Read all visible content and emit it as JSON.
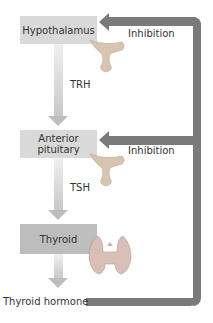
{
  "diagram": {
    "nodes": [
      {
        "id": "hypothalamus",
        "label": "Hypothalamus"
      },
      {
        "id": "anterior-pituitary",
        "label": "Anterior pituitary",
        "line1": "Anterior",
        "line2": "pituitary"
      },
      {
        "id": "thyroid",
        "label": "Thyroid"
      },
      {
        "id": "thyroid-hormone",
        "label": "Thyroid hormone"
      }
    ],
    "edges": [
      {
        "from": "hypothalamus",
        "to": "anterior-pituitary",
        "label": "TRH"
      },
      {
        "from": "anterior-pituitary",
        "to": "thyroid",
        "label": "TSH"
      },
      {
        "from": "thyroid",
        "to": "thyroid-hormone",
        "label": ""
      },
      {
        "from": "thyroid-hormone",
        "to": "hypothalamus",
        "label": "Inhibition",
        "type": "feedback"
      },
      {
        "from": "thyroid-hormone",
        "to": "anterior-pituitary",
        "label": "Inhibition",
        "type": "feedback"
      }
    ],
    "colors": {
      "box_light": "#d9d9d9",
      "box_dark": "#bdbdbd",
      "feedback": "#7a7a7a"
    }
  }
}
